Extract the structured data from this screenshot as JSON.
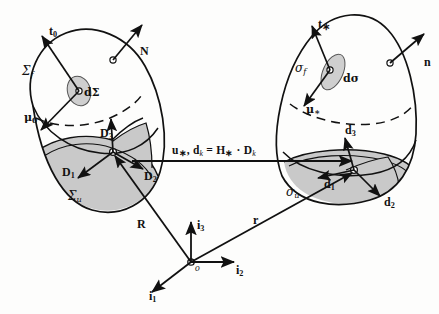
{
  "figure": {
    "type": "diagram",
    "background_color": "#fdfdfc",
    "ink_color": "#111111",
    "shaded_fill": "#c9c9c9",
    "patch_fill": "#cfcfcf"
  },
  "reference_body": {
    "name": "reference-configuration",
    "surface_label": "Σ",
    "surface_sub": "f",
    "shaded_region_label": "Σ",
    "shaded_region_sub": "u",
    "area_element_label": "dΣ",
    "vectors": [
      {
        "id": "t0",
        "label": "t",
        "sub": "0",
        "meaning": "traction-vector-reference"
      },
      {
        "id": "N",
        "label": "N",
        "sub": "",
        "meaning": "outward-unit-normal-reference"
      },
      {
        "id": "mu0",
        "label": "μ",
        "sub": "0",
        "meaning": "couple-traction-reference"
      },
      {
        "id": "D1",
        "label": "D",
        "sub": "1",
        "meaning": "director-1-reference"
      },
      {
        "id": "D2",
        "label": "D",
        "sub": "2",
        "meaning": "director-2-reference"
      },
      {
        "id": "D3",
        "label": "D",
        "sub": "3",
        "meaning": "director-3-reference"
      }
    ]
  },
  "deformed_body": {
    "name": "deformed-configuration",
    "surface_label": "σ",
    "surface_sub": "f",
    "shaded_region_label": "σ",
    "shaded_region_sub": "u",
    "area_element_label": "dσ",
    "vectors": [
      {
        "id": "t-star",
        "label": "t",
        "sub": "∗",
        "meaning": "traction-vector-deformed"
      },
      {
        "id": "n",
        "label": "n",
        "sub": "",
        "meaning": "outward-unit-normal-deformed"
      },
      {
        "id": "mu-star",
        "label": "μ",
        "sub": "∗",
        "meaning": "couple-traction-deformed"
      },
      {
        "id": "d1",
        "label": "d",
        "sub": "1",
        "meaning": "director-1-deformed"
      },
      {
        "id": "d2",
        "label": "d",
        "sub": "2",
        "meaning": "director-2-deformed"
      },
      {
        "id": "d3",
        "label": "d",
        "sub": "3",
        "meaning": "director-3-deformed"
      }
    ]
  },
  "mapping": {
    "name": "deformation-mapping-equation",
    "text_prefix": "u",
    "text_prefix_sub": "∗",
    "text_mid": ", d",
    "text_mid_sub": "k",
    "text_eq": " = H",
    "text_eq_sub": "∗",
    "text_tail": " · D",
    "text_tail_sub": "k",
    "full_text": "u∗, dₖ = H∗ · Dₖ"
  },
  "frame": {
    "name": "global-cartesian-frame",
    "origin_label": "o",
    "axes": [
      {
        "id": "i1",
        "label": "i",
        "sub": "1",
        "direction": "lower-left"
      },
      {
        "id": "i2",
        "label": "i",
        "sub": "2",
        "direction": "right"
      },
      {
        "id": "i3",
        "label": "i",
        "sub": "3",
        "direction": "up"
      }
    ],
    "position_vectors": [
      {
        "id": "R",
        "label": "R",
        "meaning": "position-vector-to-reference-configuration"
      },
      {
        "id": "r",
        "label": "r",
        "meaning": "position-vector-to-deformed-configuration"
      }
    ]
  }
}
